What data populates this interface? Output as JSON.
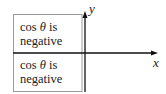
{
  "diagram": {
    "axes": {
      "x_label": "x",
      "y_label": "y"
    },
    "regions": [
      {
        "quadrant": "II",
        "line1_prefix": "cos ",
        "line1_symbol": "θ",
        "line1_suffix": " is",
        "line2": "negative"
      },
      {
        "quadrant": "III",
        "line1_prefix": "cos ",
        "line1_symbol": "θ",
        "line1_suffix": " is",
        "line2": "negative"
      }
    ],
    "colors": {
      "axis": "#111111",
      "box_border": "#9a9a9a",
      "text": "#222222"
    }
  }
}
